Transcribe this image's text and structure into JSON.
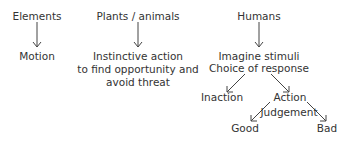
{
  "diagram": {
    "columns": [
      {
        "heading": "Elements",
        "result": "Motion"
      },
      {
        "heading": "Plants / animals",
        "result_lines": [
          "Instinctive action",
          "to find opportunity and",
          "avoid threat"
        ]
      },
      {
        "heading": "Humans",
        "result_lines": [
          "Imagine stimuli",
          "Choice of response"
        ],
        "branches": {
          "left": "Inaction",
          "right": "Action",
          "judgement_label": "Judgement",
          "outcomes": [
            "Good",
            "Bad"
          ]
        }
      }
    ],
    "colors": {
      "text": "#333333",
      "arrow": "#444444",
      "background": "#ffffff"
    }
  }
}
